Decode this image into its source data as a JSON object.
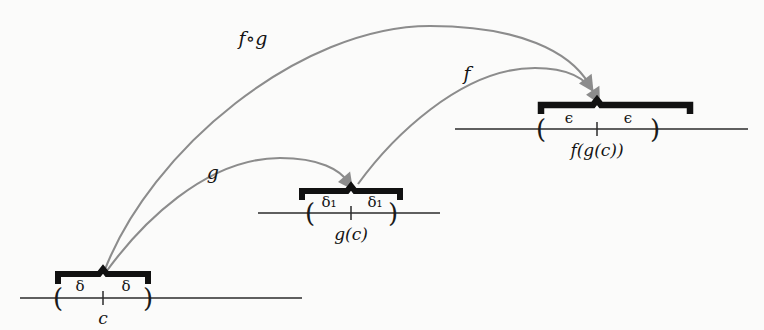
{
  "figure": {
    "background_color": "#fbfbfa",
    "arc_color": "#8c8c8c",
    "bracket_color": "#111111",
    "axis_color": "#2b2b2b",
    "arrow_color": "#8c8c8c"
  },
  "arcs": [
    {
      "name": "f-compose-g",
      "label": "f∘g",
      "from": "c-interval",
      "to": "fgc-interval",
      "label_x": 253,
      "label_y": 38
    },
    {
      "name": "g",
      "label": "g",
      "from": "c-interval",
      "to": "gc-interval",
      "label_x": 213,
      "label_y": 172
    },
    {
      "name": "f",
      "label": "f",
      "from": "gc-interval",
      "to": "fgc-interval",
      "label_x": 467,
      "label_y": 73
    }
  ],
  "number_lines": [
    {
      "name": "c-axis",
      "center_label": "c",
      "left_measure": "δ",
      "right_measure": "δ",
      "axis_y": 298,
      "axis_x_start": 20,
      "axis_x_end": 302,
      "center_x": 103,
      "left_paren_x": 58,
      "right_paren_x": 148,
      "bracket_y": 272,
      "measure_y": 286,
      "center_label_y": 318
    },
    {
      "name": "gc-axis",
      "center_label": "g(c)",
      "left_measure": "δ₁",
      "right_measure": "δ₁",
      "axis_y": 213,
      "axis_x_start": 258,
      "axis_x_end": 440,
      "center_x": 351,
      "left_paren_x": 310,
      "right_paren_x": 393,
      "bracket_y": 189,
      "measure_y": 202,
      "center_label_y": 234
    },
    {
      "name": "fgc-axis",
      "center_label": "f(g(c))",
      "left_measure": "ϵ",
      "right_measure": "ϵ",
      "axis_y": 129,
      "axis_x_start": 455,
      "axis_x_end": 748,
      "center_x": 597,
      "left_paren_x": 541,
      "right_paren_x": 655,
      "bracket_y": 103,
      "measure_y": 118,
      "center_label_y": 150
    }
  ]
}
